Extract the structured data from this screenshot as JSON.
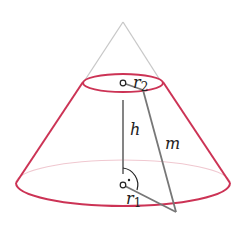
{
  "diagram": {
    "labels": {
      "r2": "r",
      "r2_sub": "2",
      "h": "h",
      "m": "m",
      "r1": "r",
      "r1_sub": "1",
      "right_angle_dot": "·"
    },
    "colors": {
      "frustum": "#cc3355",
      "apex_lines": "#c8c8c8",
      "hidden_edge": "#f0c8d0",
      "measure_lines": "#777777",
      "text": "#222222"
    }
  }
}
